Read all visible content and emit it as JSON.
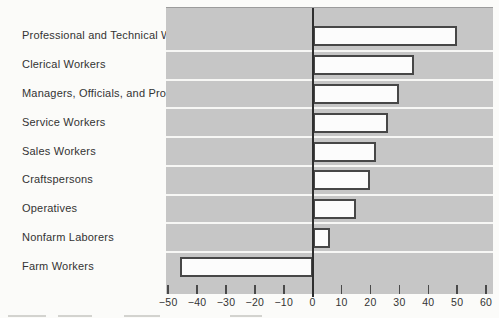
{
  "chart_data": {
    "type": "bar",
    "orientation": "horizontal",
    "title": "",
    "categories": [
      "Professional and Technical Workers",
      "Clerical Workers",
      "Managers, Officials, and Proprietors",
      "Service Workers",
      "Sales Workers",
      "Craftspersons",
      "Operatives",
      "Nonfarm Laborers",
      "Farm Workers"
    ],
    "values": [
      50,
      35,
      30,
      26,
      22,
      20,
      15,
      6,
      -46
    ],
    "x_ticks": [
      -50,
      -40,
      -30,
      -20,
      -10,
      0,
      10,
      20,
      30,
      40,
      50,
      60
    ],
    "x_tick_labels": [
      "−50",
      "−40",
      "−30",
      "−20",
      "−10",
      "0",
      "10",
      "20",
      "30",
      "40",
      "50",
      "60"
    ],
    "xlim": [
      -51,
      62.5
    ],
    "grid": "white row separators on gray plot band",
    "legend": "none"
  },
  "colors": {
    "page_bg": "#fbfbf9",
    "plot_bg": "#c6c6c6",
    "bar_fill": "#fcfcfc",
    "bar_border": "#474747",
    "row_separator": "#f7f7f5",
    "zero_line": "#2f2f2f",
    "text": "#333333"
  }
}
